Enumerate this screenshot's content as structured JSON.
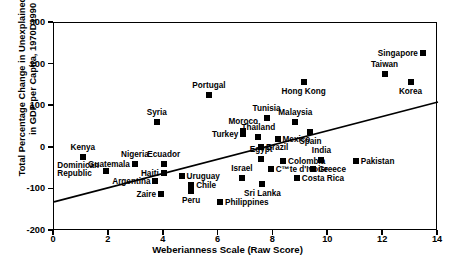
{
  "chart_data": {
    "type": "scatter",
    "title": "",
    "xlabel": "Weberianness Scale (Raw Score)",
    "ylabel_line1": "Total Percentage Change in Unexplained Growth",
    "ylabel_line2": "in GDP per Capita, 1970D1990",
    "xlim": [
      0,
      14
    ],
    "ylim": [
      -200,
      300
    ],
    "xticks": [
      0,
      2,
      4,
      6,
      8,
      10,
      12,
      14
    ],
    "yticks": [
      -200,
      -100,
      0,
      100,
      200,
      300
    ],
    "xtick_labels": [
      "0",
      "2",
      "4",
      "6",
      "8",
      "10",
      "12",
      "14"
    ],
    "ytick_labels": [
      "-200",
      "-100",
      "0",
      "100",
      "200",
      "300"
    ],
    "grid": false,
    "legend": "none",
    "marker_color": "#000000",
    "line_color": "#000000",
    "points": [
      {
        "label": "Kenya",
        "x": 1.05,
        "y": -22,
        "pos": "above"
      },
      {
        "label": "Dominican\nRepublic",
        "x": 1.9,
        "y": -55,
        "pos": "left-two"
      },
      {
        "label": "Nigeria",
        "x": 2.95,
        "y": -38,
        "pos": "above"
      },
      {
        "label": "Guatemala",
        "x": 2.95,
        "y": -38,
        "pos": "left"
      },
      {
        "label": "Syria",
        "x": 3.75,
        "y": 62,
        "pos": "above"
      },
      {
        "label": "Argentina",
        "x": 3.7,
        "y": -80,
        "pos": "left"
      },
      {
        "label": "Zaire",
        "x": 3.9,
        "y": -112,
        "pos": "left"
      },
      {
        "label": "Ecuador",
        "x": 4.0,
        "y": -40,
        "pos": "above"
      },
      {
        "label": "Haiti",
        "x": 4.0,
        "y": -60,
        "pos": "left"
      },
      {
        "label": "Uruguay",
        "x": 4.65,
        "y": -68,
        "pos": "right"
      },
      {
        "label": "Chile",
        "x": 5.0,
        "y": -90,
        "pos": "right"
      },
      {
        "label": "Peru",
        "x": 5.0,
        "y": -105,
        "pos": "below"
      },
      {
        "label": "Portugal",
        "x": 5.65,
        "y": 128,
        "pos": "above"
      },
      {
        "label": "Philippines",
        "x": 6.05,
        "y": -130,
        "pos": "right"
      },
      {
        "label": "Moroco",
        "x": 6.9,
        "y": 40,
        "pos": "above"
      },
      {
        "label": "Turkey",
        "x": 6.9,
        "y": 33,
        "pos": "left"
      },
      {
        "label": "Israel",
        "x": 6.85,
        "y": -72,
        "pos": "above"
      },
      {
        "label": "Thailand",
        "x": 7.45,
        "y": 25,
        "pos": "above"
      },
      {
        "label": "Brazil",
        "x": 7.55,
        "y": 3,
        "pos": "right"
      },
      {
        "label": "Egypt",
        "x": 7.55,
        "y": -28,
        "pos": "above"
      },
      {
        "label": "Sri Lanka",
        "x": 7.6,
        "y": -88,
        "pos": "below"
      },
      {
        "label": "Tunisia",
        "x": 7.75,
        "y": 72,
        "pos": "above"
      },
      {
        "label": "C™te d'Ivoire",
        "x": 7.9,
        "y": -50,
        "pos": "right"
      },
      {
        "label": "Mexico",
        "x": 8.15,
        "y": 22,
        "pos": "right"
      },
      {
        "label": "Colombia",
        "x": 8.35,
        "y": -32,
        "pos": "right"
      },
      {
        "label": "Malaysia",
        "x": 8.8,
        "y": 62,
        "pos": "above"
      },
      {
        "label": "Hong Kong",
        "x": 9.1,
        "y": 158,
        "pos": "below"
      },
      {
        "label": "Costa Rica",
        "x": 8.85,
        "y": -72,
        "pos": "right"
      },
      {
        "label": "Spain",
        "x": 9.35,
        "y": 38,
        "pos": "below"
      },
      {
        "label": "Greece",
        "x": 9.45,
        "y": -50,
        "pos": "right"
      },
      {
        "label": "India",
        "x": 9.75,
        "y": -30,
        "pos": "above"
      },
      {
        "label": "Taiwan",
        "x": 12.05,
        "y": 178,
        "pos": "above"
      },
      {
        "label": "Pakistan",
        "x": 11.0,
        "y": -32,
        "pos": "right"
      },
      {
        "label": "Korea",
        "x": 13.0,
        "y": 158,
        "pos": "below"
      },
      {
        "label": "Singapore",
        "x": 13.45,
        "y": 228,
        "pos": "left"
      }
    ],
    "trendline": {
      "x0": 0,
      "y0": -130,
      "x1": 14,
      "y1": 110
    }
  }
}
